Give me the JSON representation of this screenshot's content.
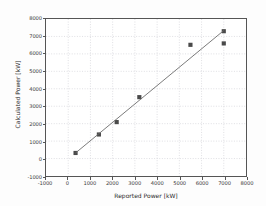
{
  "chart_data": {
    "type": "scatter",
    "title": "",
    "xlabel": "Reported Power [kW]",
    "ylabel": "Calculated Power [kW]",
    "xlim": [
      -1000,
      8000
    ],
    "ylim": [
      -1000,
      8000
    ],
    "xticks": [
      -1000,
      0,
      1000,
      2000,
      3000,
      4000,
      5000,
      6000,
      7000,
      8000
    ],
    "yticks": [
      -1000,
      0,
      1000,
      2000,
      3000,
      4000,
      5000,
      6000,
      7000,
      8000
    ],
    "xtick_labels": [
      "-1000",
      "0",
      "1000",
      "2000",
      "3000",
      "4000",
      "5000",
      "6000",
      "7000",
      "8000"
    ],
    "ytick_labels": [
      "-1000",
      "0",
      "1000",
      "2000",
      "3000",
      "4000",
      "5000",
      "6000",
      "7000",
      "8000"
    ],
    "grid": true,
    "grid_style": "dotted",
    "grid_color": "#c8c8d0",
    "legend": null,
    "series": [
      {
        "name": "data points",
        "type": "scatter",
        "marker": "square",
        "marker_color": "#4a4a4a",
        "points": [
          {
            "x": 330,
            "y": 320
          },
          {
            "x": 1380,
            "y": 1380
          },
          {
            "x": 2180,
            "y": 2090
          },
          {
            "x": 3200,
            "y": 3520
          },
          {
            "x": 5500,
            "y": 6520
          },
          {
            "x": 7000,
            "y": 7300
          },
          {
            "x": 7000,
            "y": 6600
          }
        ]
      },
      {
        "name": "fit line",
        "type": "line",
        "line_color": "#6a6a6a",
        "points": [
          {
            "x": 330,
            "y": 320
          },
          {
            "x": 7000,
            "y": 7340
          }
        ]
      }
    ]
  },
  "axis": {
    "x_title": "Reported Power [kW]",
    "y_title": "Calculated Power [kW]"
  }
}
